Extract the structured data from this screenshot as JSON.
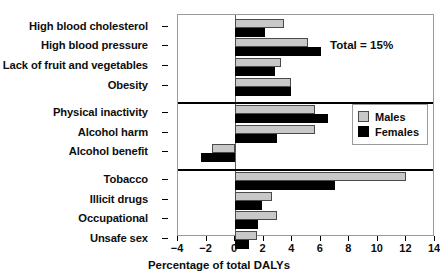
{
  "chart_data": {
    "type": "bar",
    "orientation": "horizontal",
    "title": "",
    "xlabel": "Percentage of total DALYs",
    "ylabel": "",
    "xlim": [
      -4,
      14
    ],
    "xticks": [
      -4,
      -2,
      0,
      2,
      4,
      6,
      8,
      10,
      12,
      14
    ],
    "xtick_labels": [
      "−4",
      "−2",
      "0",
      "2",
      "4",
      "6",
      "8",
      "10",
      "12",
      "14"
    ],
    "grid": false,
    "legend_position": "middle-right",
    "legend": [
      "Males",
      "Females"
    ],
    "annotations": [
      {
        "text": "Total = 15%",
        "group": 0
      }
    ],
    "groups": [
      {
        "name": "group-1",
        "categories": [
          "High blood cholesterol",
          "High blood pressure",
          "Lack of fruit and vegetables",
          "Obesity"
        ],
        "series": [
          {
            "name": "Males",
            "values": [
              3.4,
              5.1,
              3.2,
              3.9
            ]
          },
          {
            "name": "Females",
            "values": [
              2.1,
              6.0,
              2.8,
              3.9
            ]
          }
        ]
      },
      {
        "name": "group-2",
        "categories": [
          "Physical inactivity",
          "Alcohol harm",
          "Alcohol benefit"
        ],
        "series": [
          {
            "name": "Males",
            "values": [
              5.6,
              5.6,
              -1.6
            ]
          },
          {
            "name": "Females",
            "values": [
              6.5,
              2.9,
              -2.4
            ]
          }
        ]
      },
      {
        "name": "group-3",
        "categories": [
          "Tobacco",
          "Illicit drugs",
          "Occupational",
          "Unsafe sex"
        ],
        "series": [
          {
            "name": "Males",
            "values": [
              12.0,
              2.6,
              2.9,
              1.5
            ]
          },
          {
            "name": "Females",
            "values": [
              7.0,
              1.9,
              1.6,
              1.0
            ]
          }
        ]
      }
    ],
    "colors": {
      "males": "#c8c8c8",
      "females": "#000000",
      "frame": "#9a9a9a",
      "separator": "#000000",
      "text": "#0d0d0d"
    }
  },
  "legend": {
    "males_label": "Males",
    "females_label": "Females"
  },
  "annotation": {
    "total": "Total = 15%"
  },
  "axis": {
    "xlabel": "Percentage of total DALYs"
  }
}
